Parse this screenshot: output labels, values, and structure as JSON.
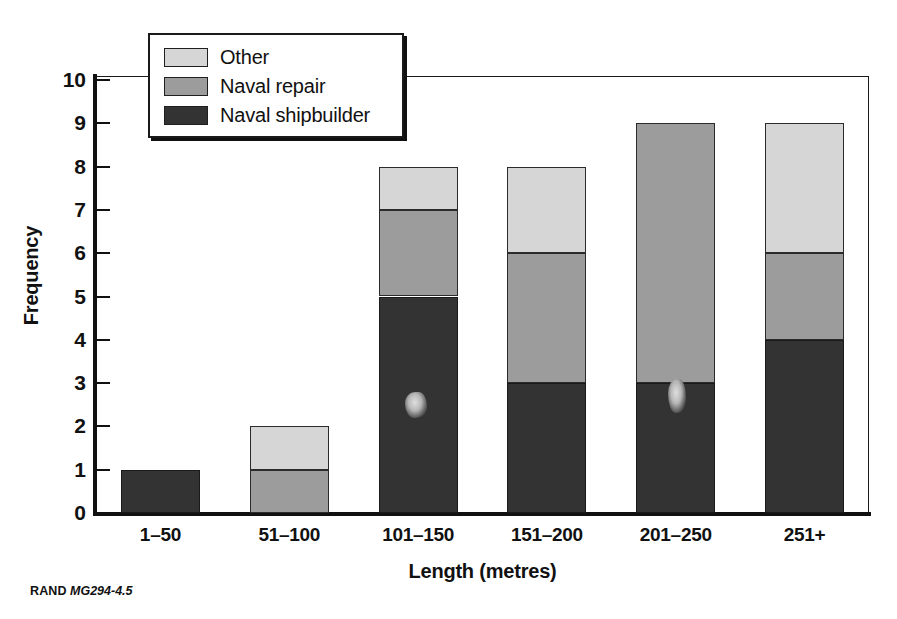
{
  "chart_data": {
    "type": "bar",
    "subtype": "stacked-vertical-bar",
    "title": "",
    "xlabel": "Length (metres)",
    "ylabel": "Frequency",
    "categories": [
      "1–50",
      "51–100",
      "101–150",
      "151–200",
      "201–250",
      "251+"
    ],
    "series": [
      {
        "name": "Naval shipbuilder",
        "color": "#333333",
        "values": [
          1,
          0,
          5,
          3,
          3,
          4
        ]
      },
      {
        "name": "Naval repair",
        "color": "#9c9c9c",
        "values": [
          0,
          1,
          2,
          3,
          6,
          2
        ]
      },
      {
        "name": "Other",
        "color": "#d6d6d6",
        "values": [
          0,
          1,
          1,
          2,
          0,
          3
        ]
      }
    ],
    "totals": [
      1,
      2,
      8,
      8,
      9,
      9
    ],
    "ylim": [
      0,
      10
    ],
    "yticks": [
      0,
      1,
      2,
      3,
      4,
      5,
      6,
      7,
      8,
      9,
      10
    ],
    "ytick_labels": [
      "0",
      "1",
      "2",
      "3",
      "4",
      "5",
      "6",
      "7",
      "8",
      "9",
      "10"
    ],
    "grid": false,
    "legend_position": "top-left-inside",
    "stack_order_bottom_to_top": [
      "Naval shipbuilder",
      "Naval repair",
      "Other"
    ]
  },
  "legend": {
    "items": [
      {
        "label": "Other",
        "color": "#d6d6d6",
        "swatch": "light-gray-swatch"
      },
      {
        "label": "Naval repair",
        "color": "#9c9c9c",
        "swatch": "mid-gray-swatch"
      },
      {
        "label": "Naval shipbuilder",
        "color": "#333333",
        "swatch": "dark-gray-swatch"
      }
    ]
  },
  "footer": {
    "publisher": "RAND",
    "figure_number": "MG294-4.5"
  }
}
